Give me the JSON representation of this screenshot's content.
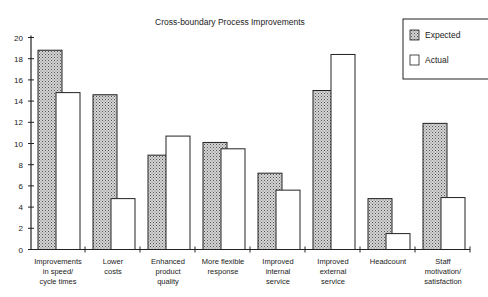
{
  "chart_data": {
    "type": "bar",
    "title": "Cross-boundary Process Improvements",
    "xlabel": "",
    "ylabel": "",
    "ylim": [
      0,
      20
    ],
    "yticks": [
      0,
      2,
      4,
      6,
      8,
      10,
      12,
      14,
      16,
      18,
      20
    ],
    "grid": false,
    "legend_position": "top-right",
    "categories": [
      [
        "Improvements",
        "in speed/",
        "cycle times"
      ],
      [
        "Lower",
        "costs"
      ],
      [
        "Enhanced",
        "product",
        "quality"
      ],
      [
        "More flexible",
        "response"
      ],
      [
        "Improved",
        "internal",
        "service"
      ],
      [
        "Improved",
        "external",
        "service"
      ],
      [
        "Headcount"
      ],
      [
        "Staff",
        "motivation/",
        "satisfaction"
      ]
    ],
    "series": [
      {
        "name": "Expected",
        "pattern": "stippled",
        "color": "#bdbdbd",
        "values": [
          18.8,
          14.6,
          8.9,
          10.1,
          7.2,
          15.0,
          4.8,
          11.9
        ]
      },
      {
        "name": "Actual",
        "pattern": "white",
        "color": "#ffffff",
        "values": [
          14.8,
          4.8,
          10.7,
          9.5,
          5.6,
          18.4,
          1.5,
          4.9
        ]
      }
    ]
  }
}
